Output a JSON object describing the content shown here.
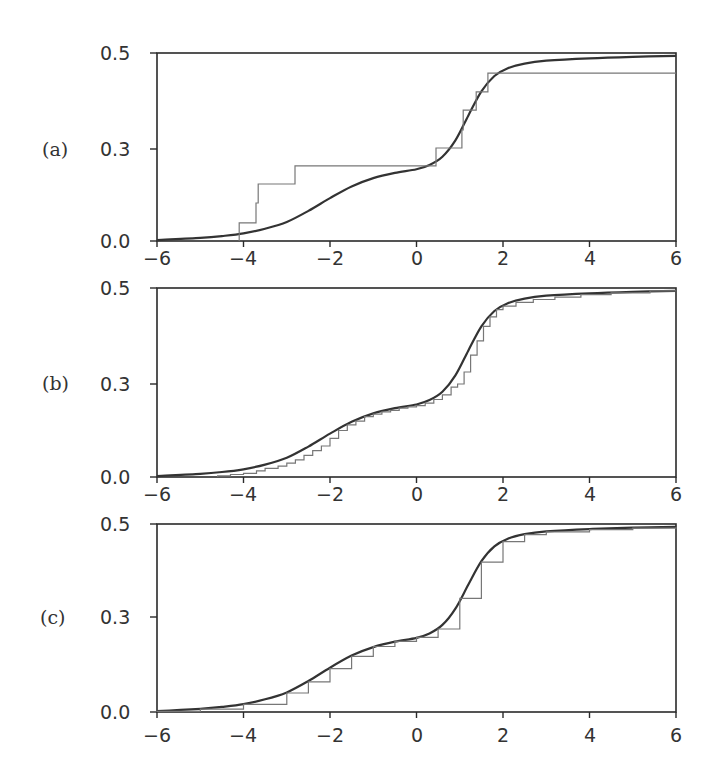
{
  "chart_data": [
    {
      "type": "line",
      "panel_label": "(a)",
      "xlabel": "",
      "ylabel": "",
      "xlim": [
        -6,
        6
      ],
      "ylim": [
        0.0,
        0.5
      ],
      "x_ticks": [
        -6,
        -4,
        -2,
        0,
        2,
        4,
        6
      ],
      "x_tick_labels": [
        "−6",
        "−4",
        "−2",
        "0",
        "2",
        "4",
        "6"
      ],
      "y_ticks": [
        0.0,
        0.3,
        0.5
      ],
      "y_tick_labels": [
        "0.0",
        "0.3",
        "0.5"
      ],
      "grid": false,
      "series": [
        {
          "name": "smooth curve",
          "style": "smooth",
          "x": [
            -6,
            -5,
            -4.5,
            -4,
            -3.5,
            -3,
            -2.5,
            -2,
            -1.5,
            -1,
            -0.5,
            0,
            0.3,
            0.6,
            0.9,
            1.2,
            1.5,
            1.8,
            2.1,
            2.5,
            3,
            4,
            5,
            6
          ],
          "y": [
            0.003,
            0.01,
            0.016,
            0.025,
            0.04,
            0.062,
            0.098,
            0.14,
            0.178,
            0.205,
            0.222,
            0.234,
            0.248,
            0.275,
            0.318,
            0.37,
            0.42,
            0.452,
            0.468,
            0.478,
            0.484,
            0.489,
            0.492,
            0.494
          ]
        },
        {
          "name": "empirical step function",
          "style": "step",
          "x": [
            -4.1,
            -3.71,
            -3.66,
            -2.81,
            0.45,
            1.05,
            1.08,
            1.38,
            1.65
          ],
          "y": [
            0.059,
            0.124,
            0.186,
            0.245,
            0.302,
            0.34,
            0.381,
            0.419,
            0.458
          ],
          "x_start": -4.1
        }
      ]
    },
    {
      "type": "line",
      "panel_label": "(b)",
      "xlabel": "",
      "ylabel": "",
      "xlim": [
        -6,
        6
      ],
      "ylim": [
        0.0,
        0.5
      ],
      "x_ticks": [
        -6,
        -4,
        -2,
        0,
        2,
        4,
        6
      ],
      "x_tick_labels": [
        "−6",
        "−4",
        "−2",
        "0",
        "2",
        "4",
        "6"
      ],
      "y_ticks": [
        0.0,
        0.3,
        0.5
      ],
      "y_tick_labels": [
        "0.0",
        "0.3",
        "0.5"
      ],
      "grid": false,
      "series": [
        {
          "name": "smooth curve",
          "style": "smooth",
          "x": [
            -6,
            -5,
            -4.5,
            -4,
            -3.5,
            -3,
            -2.5,
            -2,
            -1.5,
            -1,
            -0.5,
            0,
            0.3,
            0.6,
            0.9,
            1.2,
            1.5,
            1.8,
            2.1,
            2.5,
            3,
            4,
            5,
            6
          ],
          "y": [
            0.003,
            0.01,
            0.016,
            0.025,
            0.04,
            0.062,
            0.098,
            0.14,
            0.178,
            0.205,
            0.222,
            0.234,
            0.248,
            0.275,
            0.318,
            0.37,
            0.42,
            0.452,
            0.468,
            0.478,
            0.484,
            0.489,
            0.492,
            0.494
          ]
        },
        {
          "name": "empirical step function",
          "style": "step",
          "x": [
            -4.6,
            -4.3,
            -4.0,
            -3.7,
            -3.5,
            -3.2,
            -3.0,
            -2.8,
            -2.6,
            -2.4,
            -2.2,
            -2.0,
            -1.8,
            -1.6,
            -1.4,
            -1.2,
            -1.0,
            -0.8,
            -0.6,
            -0.4,
            -0.2,
            0.0,
            0.2,
            0.4,
            0.6,
            0.8,
            0.95,
            1.1,
            1.25,
            1.4,
            1.55,
            1.7,
            1.85,
            2.0,
            2.3,
            2.7,
            3.2,
            3.8,
            4.5,
            5.4
          ],
          "y": [
            0.004,
            0.008,
            0.012,
            0.02,
            0.028,
            0.035,
            0.045,
            0.055,
            0.07,
            0.085,
            0.1,
            0.125,
            0.15,
            0.168,
            0.18,
            0.195,
            0.203,
            0.21,
            0.215,
            0.222,
            0.226,
            0.23,
            0.238,
            0.25,
            0.265,
            0.29,
            0.3,
            0.325,
            0.36,
            0.39,
            0.42,
            0.44,
            0.455,
            0.462,
            0.47,
            0.476,
            0.481,
            0.486,
            0.49,
            0.494
          ],
          "x_start": -4.6
        }
      ]
    },
    {
      "type": "line",
      "panel_label": "(c)",
      "xlabel": "",
      "ylabel": "",
      "xlim": [
        -6,
        6
      ],
      "ylim": [
        0.0,
        0.5
      ],
      "x_ticks": [
        -6,
        -4,
        -2,
        0,
        2,
        4,
        6
      ],
      "x_tick_labels": [
        "−6",
        "−4",
        "−2",
        "0",
        "2",
        "4",
        "6"
      ],
      "y_ticks": [
        0.0,
        0.3,
        0.5
      ],
      "y_tick_labels": [
        "0.0",
        "0.3",
        "0.5"
      ],
      "grid": false,
      "series": [
        {
          "name": "smooth curve",
          "style": "smooth",
          "x": [
            -6,
            -5,
            -4.5,
            -4,
            -3.5,
            -3,
            -2.5,
            -2,
            -1.5,
            -1,
            -0.5,
            0,
            0.3,
            0.6,
            0.9,
            1.2,
            1.5,
            1.8,
            2.1,
            2.5,
            3,
            4,
            5,
            6
          ],
          "y": [
            0.003,
            0.01,
            0.016,
            0.025,
            0.04,
            0.062,
            0.098,
            0.14,
            0.178,
            0.205,
            0.222,
            0.234,
            0.248,
            0.275,
            0.318,
            0.37,
            0.42,
            0.452,
            0.468,
            0.478,
            0.484,
            0.489,
            0.492,
            0.494
          ]
        },
        {
          "name": "empirical estimate (near-coincident)",
          "style": "step",
          "x": [
            -6,
            -5,
            -4,
            -3,
            -2.5,
            -2,
            -1.5,
            -1,
            -0.5,
            0,
            0.5,
            1,
            1.5,
            2,
            2.5,
            3,
            4,
            5,
            6
          ],
          "y": [
            0.002,
            0.009,
            0.024,
            0.06,
            0.095,
            0.137,
            0.176,
            0.207,
            0.223,
            0.236,
            0.262,
            0.34,
            0.418,
            0.462,
            0.477,
            0.483,
            0.488,
            0.491,
            0.493
          ],
          "x_start": -6
        }
      ]
    }
  ]
}
